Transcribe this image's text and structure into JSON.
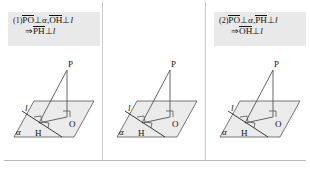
{
  "page": {
    "background": "#ffffff",
    "header_box_color": "#e9e9e9",
    "line_color": "#4a4a4a",
    "plane_fill": "#ebebeb",
    "text_color": "#16130f"
  },
  "columns": [
    {
      "number": "(1)",
      "formula": {
        "line1": {
          "seg_a": "PO",
          "rel_a": "⊥",
          "obj_a": "α",
          "sep": ",",
          "seg_b": "OH",
          "rel_b": "⊥",
          "obj_b": "l"
        },
        "line2": {
          "arrow": "⇒",
          "seg": "PH",
          "rel": "⊥",
          "obj": "l"
        },
        "line3": null
      },
      "diagram": {
        "plane_label": "α",
        "line_label": "l",
        "points": [
          "P",
          "O",
          "H"
        ],
        "right_angles": [
          "at-O",
          "at-H-left",
          "at-H-right"
        ]
      }
    },
    {
      "number": "(2)",
      "formula": {
        "line1": {
          "seg_a": "PO",
          "rel_a": "⊥",
          "obj_a": "α",
          "sep": ",",
          "seg_b": "PH",
          "rel_b": "⊥",
          "obj_b": "l"
        },
        "line2": {
          "arrow": "⇒",
          "seg": "OH",
          "rel": "⊥",
          "obj": "l"
        },
        "line3": null
      },
      "diagram": {
        "plane_label": "α",
        "line_label": "l",
        "points": [
          "P",
          "O",
          "H"
        ],
        "right_angles": [
          "at-O",
          "at-H-left",
          "at-H-right"
        ]
      }
    },
    {
      "number": "(3)",
      "formula": {
        "line1": {
          "seg_a": "PH",
          "rel_a": "⊥",
          "obj_a": "l",
          "sep": ",",
          "seg_b": "OH",
          "rel_b": "⊥",
          "obj_b": "l,"
        },
        "line2": {
          "seg_a": "PO",
          "rel_a": "⊥",
          "seg_b": "OH"
        },
        "line3": {
          "arrow": "⇒",
          "seg": "PO",
          "rel": "⊥",
          "obj": "α"
        }
      },
      "diagram": {
        "plane_label": "α",
        "line_label": "l",
        "points": [
          "P",
          "O",
          "H"
        ],
        "right_angles": [
          "at-O",
          "at-H-left",
          "at-H-right"
        ]
      }
    }
  ]
}
